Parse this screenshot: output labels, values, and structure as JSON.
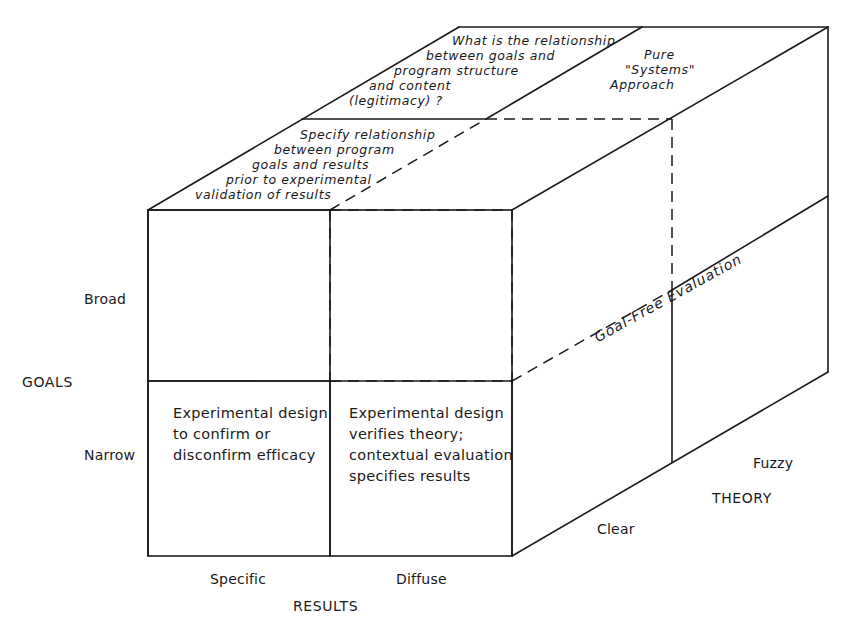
{
  "diagram": {
    "type": "3d-cube-matrix",
    "axes": {
      "goals": {
        "title": "GOALS",
        "levels": [
          "Broad",
          "Narrow"
        ]
      },
      "results": {
        "title": "RESULTS",
        "levels": [
          "Specific",
          "Diffuse"
        ]
      },
      "theory": {
        "title": "THEORY",
        "levels": [
          "Clear",
          "Fuzzy"
        ]
      }
    },
    "front_cells": {
      "narrow_specific": [
        "Experimental design",
        "to confirm or",
        "disconfirm efficacy"
      ],
      "narrow_diffuse": [
        "Experimental design",
        "verifies theory;",
        "contextual evaluation",
        "specifies results"
      ]
    },
    "top_face": {
      "front_strip": [
        "Specify relationship",
        "between program",
        "goals and results",
        "prior to experimental",
        "validation of results"
      ],
      "back_left": [
        "What is the relationship",
        "between goals and",
        "program structure",
        "and content",
        "(legitimacy) ?"
      ],
      "back_right": [
        "Pure",
        "\"Systems\"",
        "Approach"
      ]
    },
    "side_face": {
      "label": "Goal-Free Evaluation"
    }
  }
}
